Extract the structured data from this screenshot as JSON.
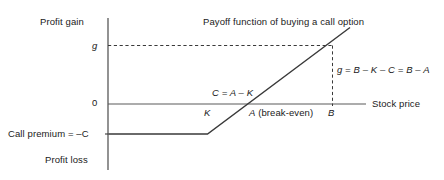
{
  "figure": {
    "title": "Payoff function of buying a call option",
    "axes": {
      "y_axis_top_label": "Profit gain",
      "y_axis_bottom_label": "Profit loss",
      "x_axis_label": "Stock price"
    },
    "tick_labels": {
      "y_gain": "g",
      "y_zero": "0",
      "y_premium": "Call premium = –C",
      "x_strike": "K",
      "x_breakeven": "A (break-even)",
      "x_point_b": "B"
    },
    "annotations": {
      "premium_relation": "C = A – K",
      "gain_relation": "g = B – K – C = B – A"
    },
    "colors": {
      "line": "#3a3a3a",
      "axis": "#3a3a3a",
      "dashed": "#3a3a3a",
      "text": "#1a1a1a",
      "background": "#ffffff"
    }
  },
  "chart_data": {
    "type": "line",
    "title": "Payoff function of buying a call option",
    "xlabel": "Stock price",
    "ylabel": "Profit gain",
    "grid": false,
    "legend": null,
    "series": [
      {
        "name": "Payoff of long call",
        "points": [
          {
            "x": "0",
            "y": "-C"
          },
          {
            "x": "K",
            "y": "-C"
          },
          {
            "x": "A",
            "y": "0"
          },
          {
            "x": "B",
            "y": "g"
          },
          {
            "x": ">B",
            "y": ">g"
          }
        ]
      }
    ],
    "reference_lines": [
      {
        "name": "gain-level-dashed",
        "orientation": "horizontal",
        "value": "g"
      },
      {
        "name": "point-b-dashed",
        "orientation": "vertical",
        "value": "B"
      },
      {
        "name": "zero-profit-axis",
        "orientation": "horizontal",
        "value": "0"
      },
      {
        "name": "premium-level",
        "orientation": "horizontal",
        "value": "-C"
      }
    ]
  }
}
